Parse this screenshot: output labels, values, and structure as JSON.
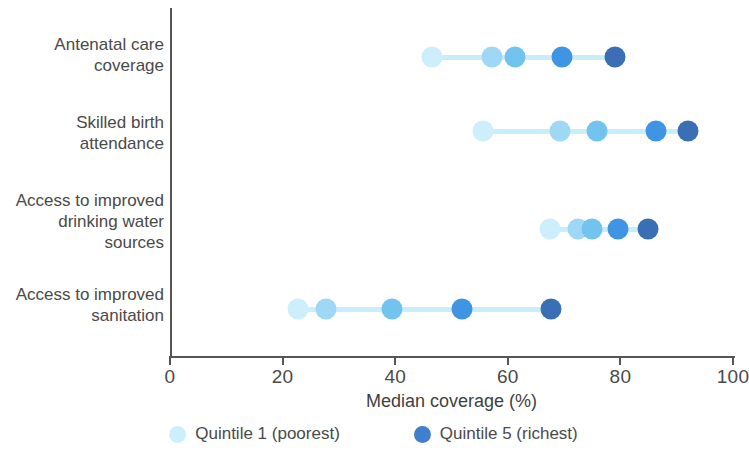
{
  "chart_data": {
    "type": "scatter",
    "title": "",
    "xlabel": "Median coverage (%)",
    "ylabel": "",
    "xlim": [
      0,
      100
    ],
    "xticks": [
      0,
      20,
      40,
      60,
      80,
      100
    ],
    "xtick_labels": [
      "0",
      "20",
      "40",
      "60",
      "80",
      "100"
    ],
    "grid": false,
    "legend_position": "bottom",
    "categories": [
      "Antenatal care coverage",
      "Skilled birth attendance",
      "Access to improved drinking water sources",
      "Access to improved sanitation"
    ],
    "category_label_lines": [
      [
        "Antenatal care",
        "coverage"
      ],
      [
        "Skilled birth",
        "attendance"
      ],
      [
        "Access to improved",
        "drinking water",
        "sources"
      ],
      [
        "Access to improved",
        "sanitation"
      ]
    ],
    "series": [
      {
        "name": "Quintile 1 (poorest)",
        "color": "#cdeefb",
        "values": [
          46.5,
          55.6,
          67.5,
          22.7
        ]
      },
      {
        "name": "Quintile 2",
        "color": "#9ed8f5",
        "values": [
          57.2,
          69.3,
          72.5,
          27.7
        ]
      },
      {
        "name": "Quintile 3",
        "color": "#72c4ef",
        "values": [
          61.3,
          75.9,
          75.0,
          39.4
        ]
      },
      {
        "name": "Quintile 4",
        "color": "#3f95e3",
        "values": [
          69.6,
          86.4,
          79.6,
          51.9
        ]
      },
      {
        "name": "Quintile 5 (richest)",
        "color": "#3a6fb5",
        "values": [
          79.0,
          92.0,
          84.9,
          67.7
        ]
      }
    ],
    "legend": [
      {
        "label": "Quintile 1 (poorest)",
        "color": "#cdeefb"
      },
      {
        "label": "Quintile 5 (richest)",
        "color": "#3f7fcf"
      }
    ],
    "connector_color": "#c9eefb",
    "axis_color": "#555555"
  }
}
